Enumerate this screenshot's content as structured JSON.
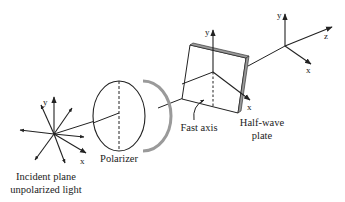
{
  "diagram": {
    "labels": {
      "incident_line1": "Incident plane",
      "incident_line2": "unpolarized light",
      "polarizer": "Polarizer",
      "fast_axis": "Fast axis",
      "hwp_line1": "Half-wave",
      "hwp_line2": "plate"
    },
    "axes": {
      "incident": {
        "y": "y",
        "x": "x"
      },
      "plate": {
        "y": "y",
        "x": "x"
      },
      "output": {
        "y": "y",
        "x": "x",
        "z": "z"
      }
    },
    "colors": {
      "stroke": "#222222",
      "shadow": "#9a9a9a",
      "background": "#ffffff"
    }
  }
}
